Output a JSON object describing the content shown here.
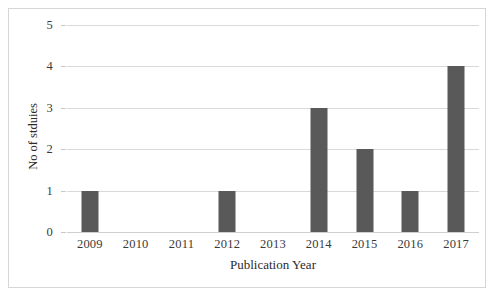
{
  "chart_data": {
    "type": "bar",
    "title": "",
    "subtitle": "",
    "categories": [
      "2009",
      "2010",
      "2011",
      "2012",
      "2013",
      "2014",
      "2015",
      "2016",
      "2017"
    ],
    "values": [
      1,
      0,
      0,
      1,
      0,
      3,
      2,
      1,
      4
    ],
    "xlabel": "Publication Year",
    "ylabel": "No of stduies",
    "ylim": [
      0,
      5
    ],
    "yticks": [
      "0",
      "1",
      "2",
      "3",
      "4",
      "5"
    ],
    "ytick_values": [
      0,
      1,
      2,
      3,
      4,
      5
    ],
    "grid": "horizontal",
    "legend": "none",
    "annotations": [],
    "series": [
      {
        "name": "No of stduies",
        "values": [
          1,
          0,
          0,
          1,
          0,
          3,
          2,
          1,
          4
        ]
      }
    ]
  },
  "style": {
    "bar_color": "#595959",
    "gridline_color": "#d9d9d9",
    "border_color": "#d6d6d6",
    "text_color": "#3a3a3a",
    "background": "#ffffff"
  }
}
